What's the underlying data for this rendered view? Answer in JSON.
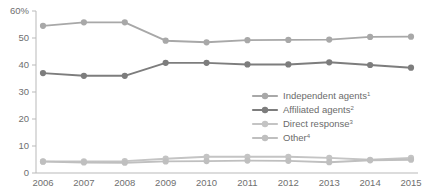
{
  "chart_data": {
    "type": "line",
    "title": "",
    "xlabel": "",
    "ylabel": "",
    "x": [
      2006,
      2007,
      2008,
      2009,
      2010,
      2011,
      2012,
      2013,
      2014,
      2015
    ],
    "categories": [
      "2006",
      "2007",
      "2008",
      "2009",
      "2010",
      "2011",
      "2012",
      "2013",
      "2014",
      "2015"
    ],
    "ylim": [
      0,
      60
    ],
    "yticks": [
      0,
      10,
      20,
      30,
      40,
      50,
      60
    ],
    "ytick_labels": [
      "0",
      "10",
      "20",
      "30",
      "40",
      "50",
      "60%"
    ],
    "grid": false,
    "legend_position": "right-middle",
    "series": [
      {
        "name": "Independent agents",
        "footnote": "1",
        "color": "#a8a8a8",
        "values": [
          54.5,
          55.8,
          55.8,
          49.0,
          48.4,
          49.2,
          49.3,
          49.4,
          50.4,
          50.5
        ]
      },
      {
        "name": "Affiliated agents",
        "footnote": "2",
        "color": "#7d7d7d",
        "values": [
          37.0,
          36.0,
          36.0,
          40.8,
          40.8,
          40.2,
          40.2,
          41.0,
          40.0,
          39.0
        ]
      },
      {
        "name": "Direct response",
        "footnote": "3",
        "color": "#c4c4c4",
        "values": [
          4.3,
          4.3,
          4.4,
          5.3,
          6.0,
          6.0,
          6.0,
          5.6,
          4.9,
          5.6
        ]
      },
      {
        "name": "Other",
        "footnote": "4",
        "color": "#bfbfbf",
        "values": [
          4.2,
          3.9,
          3.8,
          4.3,
          4.4,
          4.6,
          4.5,
          4.0,
          4.7,
          4.9
        ]
      }
    ]
  },
  "legend": {
    "items": [
      {
        "label": "Independent agents",
        "sup": "1"
      },
      {
        "label": "Affiliated agents",
        "sup": "2"
      },
      {
        "label": "Direct response",
        "sup": "3"
      },
      {
        "label": "Other",
        "sup": "4"
      }
    ]
  },
  "colors": {
    "independent": "#a8a8a8",
    "affiliated": "#7d7d7d",
    "direct": "#c4c4c4",
    "other": "#bfbfbf",
    "axis": "#b9b9b9",
    "text": "#6f6f6f",
    "background": "#ffffff"
  }
}
